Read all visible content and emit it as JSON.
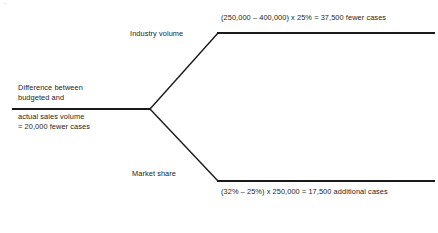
{
  "diagram": {
    "type": "variance-decomposition-tree",
    "artifact_text": "...",
    "root": {
      "line_1": "Difference between",
      "line_2": "budgeted and",
      "line_3": "actual sales volume",
      "line_4": "= 20,000 fewer cases"
    },
    "branches": [
      {
        "id": "industry-volume",
        "label": "Industry volume",
        "formula": "(250,000 – 400,000) x 25% = 37,500 fewer cases"
      },
      {
        "id": "market-share",
        "label": "Market share",
        "formula": "(32% – 25%) x 250,000 = 17,500 additional cases"
      }
    ],
    "colors": {
      "line": "#1a1a1a",
      "text": "#1d1d1d",
      "background": "#ffffff"
    }
  }
}
